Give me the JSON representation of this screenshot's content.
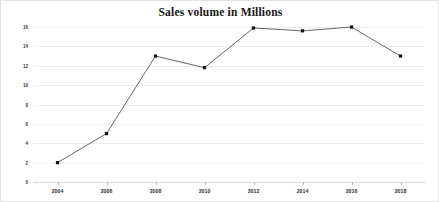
{
  "chart_data": {
    "type": "line",
    "title": "Sales volume in Millions",
    "xlabel": "",
    "ylabel": "",
    "categories": [
      "2004",
      "2006",
      "2008",
      "2010",
      "2012",
      "2014",
      "2016",
      "2018"
    ],
    "x": [
      2004,
      2006,
      2008,
      2010,
      2012,
      2014,
      2016,
      2018
    ],
    "values": [
      2,
      5,
      13,
      11.8,
      15.9,
      15.6,
      16,
      13
    ],
    "series": [
      {
        "name": "Sales volume",
        "values": [
          2,
          5,
          13,
          11.8,
          15.9,
          15.6,
          16,
          13
        ]
      }
    ],
    "ylim": [
      0,
      16
    ],
    "xlim": [
      2003,
      2019
    ],
    "yticks": [
      0,
      2,
      4,
      6,
      8,
      10,
      12,
      14,
      16
    ],
    "ytick_labels": [
      "0",
      "2",
      "4",
      "6",
      "8",
      "10",
      "12",
      "14",
      "16"
    ],
    "xtick_labels": [
      "2004",
      "2006",
      "2008",
      "2010",
      "2012",
      "2014",
      "2016",
      "2018"
    ],
    "grid": true,
    "grid_axis": "y",
    "legend": false,
    "legend_position": "none",
    "marker": "square",
    "colors": {
      "background": "#ffffff",
      "line": "#555555",
      "marker": "#111111",
      "gridline": "#ededed",
      "axis": "#d8d8d8",
      "title_text": "#161616",
      "tick_text": "#2e2e2e",
      "border": "#e3e3e3"
    }
  }
}
